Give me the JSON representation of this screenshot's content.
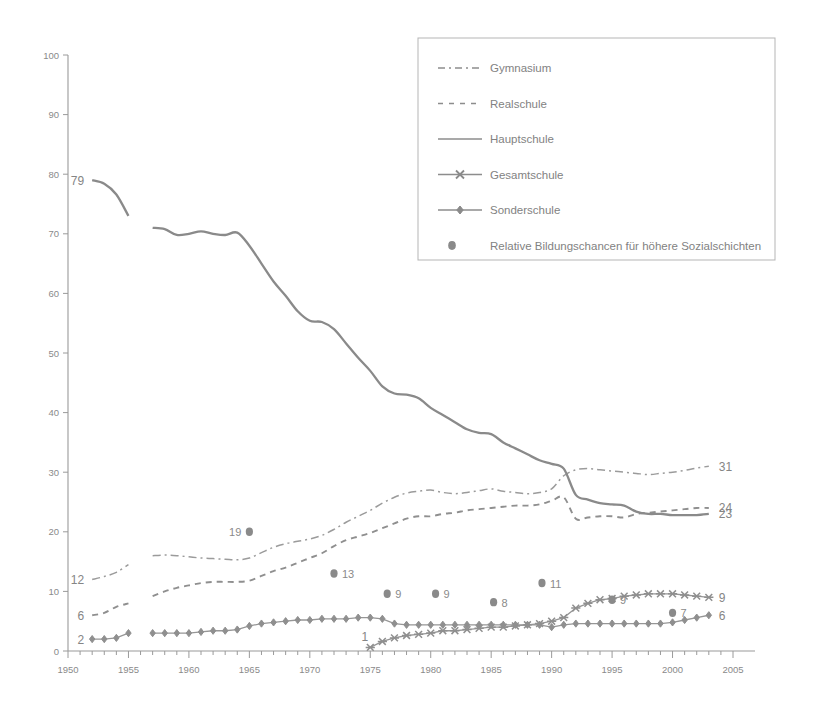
{
  "chart_data": {
    "type": "line",
    "title": "",
    "subtitle": "",
    "xlabel": "",
    "ylabel": "",
    "xlim": [
      1950,
      2005
    ],
    "ylim": [
      0,
      100
    ],
    "grid": false,
    "legend_position": "top-right",
    "y_ticks": [
      0,
      10,
      20,
      30,
      40,
      50,
      60,
      70,
      80,
      90,
      100
    ],
    "x_ticks": [
      1950,
      1955,
      1960,
      1965,
      1970,
      1975,
      1980,
      1985,
      1990,
      1995,
      2000,
      2005
    ],
    "x_minor_tick_step": 1,
    "series": [
      {
        "name": "Gymnasium",
        "style": "dash-dot",
        "marker": "none",
        "start_label": "12",
        "end_label": "31",
        "x": [
          1952,
          1953,
          1954,
          1955,
          1957,
          1958,
          1959,
          1960,
          1961,
          1962,
          1963,
          1964,
          1965,
          1966,
          1967,
          1968,
          1969,
          1970,
          1971,
          1972,
          1973,
          1974,
          1975,
          1976,
          1977,
          1978,
          1979,
          1980,
          1981,
          1982,
          1983,
          1984,
          1985,
          1986,
          1987,
          1988,
          1989,
          1990,
          1991,
          1992,
          1993,
          1994,
          1995,
          1996,
          1997,
          1998,
          1999,
          2000,
          2001,
          2002,
          2003
        ],
        "values": [
          12,
          12.5,
          13.2,
          14.5,
          16.0,
          16.1,
          16.0,
          15.8,
          15.6,
          15.5,
          15.4,
          15.3,
          15.6,
          16.5,
          17.4,
          18.0,
          18.4,
          18.8,
          19.4,
          20.4,
          21.6,
          22.6,
          23.6,
          24.8,
          25.8,
          26.5,
          26.8,
          27.0,
          26.6,
          26.4,
          26.6,
          26.9,
          27.2,
          26.8,
          26.6,
          26.4,
          26.6,
          27.2,
          29.4,
          30.4,
          30.6,
          30.4,
          30.2,
          30.0,
          29.8,
          29.6,
          29.8,
          30.0,
          30.3,
          30.7,
          31.0
        ]
      },
      {
        "name": "Realschule",
        "style": "dashed",
        "marker": "none",
        "start_label": "6",
        "end_label": "24",
        "x": [
          1952,
          1953,
          1954,
          1955,
          1957,
          1958,
          1959,
          1960,
          1961,
          1962,
          1963,
          1964,
          1965,
          1966,
          1967,
          1968,
          1969,
          1970,
          1971,
          1972,
          1973,
          1974,
          1975,
          1976,
          1977,
          1978,
          1979,
          1980,
          1981,
          1982,
          1983,
          1984,
          1985,
          1986,
          1987,
          1988,
          1989,
          1990,
          1991,
          1992,
          1993,
          1994,
          1995,
          1996,
          1997,
          1998,
          1999,
          2000,
          2001,
          2002,
          2003
        ],
        "values": [
          6,
          6.4,
          7.4,
          8.0,
          9.2,
          10.0,
          10.6,
          11.0,
          11.4,
          11.6,
          11.6,
          11.6,
          11.8,
          12.6,
          13.4,
          14.0,
          14.8,
          15.6,
          16.4,
          17.6,
          18.6,
          19.2,
          19.8,
          20.6,
          21.4,
          22.2,
          22.6,
          22.6,
          23.0,
          23.2,
          23.6,
          23.8,
          24.0,
          24.2,
          24.4,
          24.4,
          24.6,
          25.2,
          25.8,
          22.2,
          22.4,
          22.6,
          22.6,
          22.4,
          23.0,
          23.2,
          23.4,
          23.6,
          23.8,
          24.0,
          24.0
        ]
      },
      {
        "name": "Hauptschule",
        "style": "solid",
        "marker": "none",
        "start_label": "79",
        "end_label": "23",
        "x": [
          1952,
          1953,
          1954,
          1955,
          1957,
          1958,
          1959,
          1960,
          1961,
          1962,
          1963,
          1964,
          1965,
          1966,
          1967,
          1968,
          1969,
          1970,
          1971,
          1972,
          1973,
          1974,
          1975,
          1976,
          1977,
          1978,
          1979,
          1980,
          1981,
          1982,
          1983,
          1984,
          1985,
          1986,
          1987,
          1988,
          1989,
          1990,
          1991,
          1992,
          1993,
          1994,
          1995,
          1996,
          1997,
          1998,
          1999,
          2000,
          2001,
          2002,
          2003
        ],
        "values": [
          79,
          78.4,
          76.6,
          73.0,
          71.0,
          70.8,
          69.8,
          70.0,
          70.4,
          70.0,
          69.8,
          70.2,
          68.0,
          65.0,
          62.0,
          59.6,
          57.0,
          55.4,
          55.2,
          54.0,
          51.6,
          49.2,
          47.0,
          44.4,
          43.2,
          43.0,
          42.4,
          40.8,
          39.6,
          38.4,
          37.2,
          36.6,
          36.4,
          35.0,
          34.0,
          33.0,
          32.0,
          31.4,
          30.6,
          26.2,
          25.4,
          24.8,
          24.6,
          24.4,
          23.4,
          23.0,
          23.0,
          22.8,
          22.8,
          22.8,
          23.0
        ]
      },
      {
        "name": "Gesamtschule",
        "style": "solid-marker",
        "marker": "x",
        "start_label": "1",
        "end_label": "9",
        "x": [
          1975,
          1976,
          1977,
          1978,
          1979,
          1980,
          1981,
          1982,
          1983,
          1984,
          1985,
          1986,
          1987,
          1988,
          1989,
          1990,
          1991,
          1992,
          1993,
          1994,
          1995,
          1996,
          1997,
          1998,
          1999,
          2000,
          2001,
          2002,
          2003
        ],
        "values": [
          0.6,
          1.6,
          2.2,
          2.6,
          2.8,
          3.0,
          3.4,
          3.4,
          3.6,
          3.8,
          4.0,
          4.0,
          4.2,
          4.4,
          4.6,
          5.0,
          5.6,
          7.2,
          8.0,
          8.6,
          8.8,
          9.2,
          9.4,
          9.6,
          9.6,
          9.6,
          9.4,
          9.2,
          9.0
        ]
      },
      {
        "name": "Sonderschule",
        "style": "solid-marker",
        "marker": "diamond",
        "start_label": "2",
        "end_label": "6",
        "x": [
          1952,
          1953,
          1954,
          1955,
          1957,
          1958,
          1959,
          1960,
          1961,
          1962,
          1963,
          1964,
          1965,
          1966,
          1967,
          1968,
          1969,
          1970,
          1971,
          1972,
          1973,
          1974,
          1975,
          1976,
          1977,
          1978,
          1979,
          1980,
          1981,
          1982,
          1983,
          1984,
          1985,
          1986,
          1987,
          1988,
          1989,
          1990,
          1991,
          1992,
          1993,
          1994,
          1995,
          1996,
          1997,
          1998,
          1999,
          2000,
          2001,
          2002,
          2003
        ],
        "values": [
          2,
          2.0,
          2.2,
          3.0,
          3.0,
          3.0,
          3.0,
          3.0,
          3.2,
          3.4,
          3.4,
          3.6,
          4.2,
          4.6,
          4.8,
          5.0,
          5.2,
          5.2,
          5.4,
          5.4,
          5.4,
          5.6,
          5.6,
          5.4,
          4.6,
          4.4,
          4.4,
          4.4,
          4.4,
          4.4,
          4.4,
          4.4,
          4.4,
          4.4,
          4.4,
          4.4,
          4.4,
          4.0,
          4.4,
          4.6,
          4.6,
          4.6,
          4.6,
          4.6,
          4.6,
          4.6,
          4.6,
          4.8,
          5.2,
          5.6,
          6.0
        ]
      }
    ],
    "annotation_points": {
      "name": "Relative Bildungschancen für höhere Sozialschichten",
      "marker": "dot",
      "points": [
        {
          "x": 1965,
          "y": 20,
          "label": "19",
          "label_side": "left"
        },
        {
          "x": 1972,
          "y": 13,
          "label": "13",
          "label_side": "right"
        },
        {
          "x": 1976.4,
          "y": 9.6,
          "label": "9",
          "label_side": "right"
        },
        {
          "x": 1980.4,
          "y": 9.6,
          "label": "9",
          "label_side": "right"
        },
        {
          "x": 1985.2,
          "y": 8.2,
          "label": "8",
          "label_side": "right"
        },
        {
          "x": 1989.2,
          "y": 11.4,
          "label": "11",
          "label_side": "right"
        },
        {
          "x": 1995.0,
          "y": 8.6,
          "label": "9",
          "label_side": "right"
        },
        {
          "x": 2000.0,
          "y": 6.4,
          "label": "7",
          "label_side": "right"
        }
      ]
    }
  },
  "legend": {
    "items": [
      {
        "label": "Gymnasium",
        "style": "dash-dot",
        "marker": "none"
      },
      {
        "label": "Realschule",
        "style": "dashed",
        "marker": "none"
      },
      {
        "label": "Hauptschule",
        "style": "solid",
        "marker": "none"
      },
      {
        "label": "Gesamtschule",
        "style": "solid-marker",
        "marker": "x"
      },
      {
        "label": "Sonderschule",
        "style": "solid-marker",
        "marker": "diamond"
      },
      {
        "label": "Relative Bildungschancen für höhere Sozialschichten",
        "style": "dot-only",
        "marker": "dot"
      }
    ]
  },
  "colors": {
    "line": "#8d8d8d",
    "axis": "#9a9a9a",
    "text": "#858585",
    "background": "#ffffff"
  }
}
